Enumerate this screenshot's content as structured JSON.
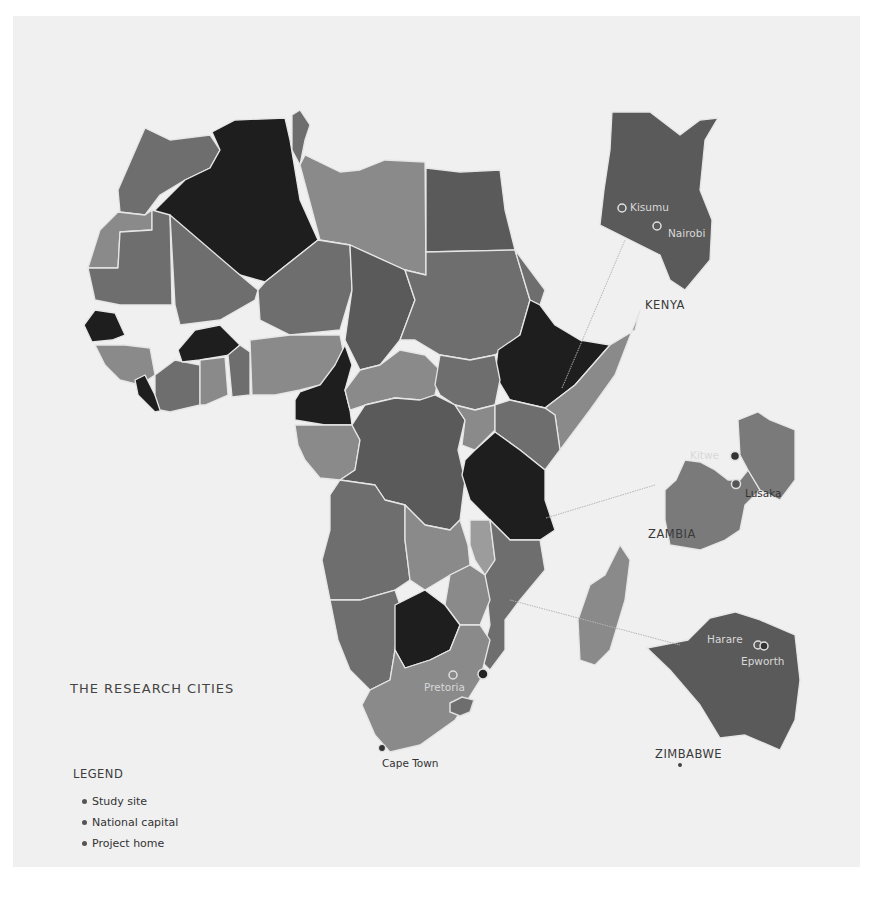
{
  "title": "THE RESEARCH CITIES",
  "legend": {
    "title": "LEGEND",
    "items": [
      {
        "label": "Study site",
        "icon": "study-site-dot"
      },
      {
        "label": "National capital",
        "icon": "national-capital-dot"
      },
      {
        "label": "Project home",
        "icon": "project-home-dot"
      }
    ]
  },
  "colors": {
    "background": "#ffffff",
    "panel": "#f0f0f0",
    "darkest": "#1e1e1e",
    "dark": "#555555",
    "medium": "#6e6e6e",
    "light": "#8a8a8a",
    "lighter": "#9c9c9c",
    "border": "#e6e6e6",
    "leader_line": "#b5b5b5"
  },
  "insets": [
    {
      "country": "KENYA",
      "cities": [
        {
          "name": "Kisumu"
        },
        {
          "name": "Nairobi"
        }
      ]
    },
    {
      "country": "ZAMBIA",
      "cities": [
        {
          "name": "Kitwe"
        },
        {
          "name": "Lusaka"
        }
      ]
    },
    {
      "country": "ZIMBABWE",
      "cities": [
        {
          "name": "Harare"
        },
        {
          "name": "Epworth"
        }
      ]
    }
  ],
  "main_map_cities": [
    {
      "name": "Pretoria"
    },
    {
      "name": "Cape Town"
    }
  ],
  "map_shapes": {
    "countries": [
      {
        "name": "morocco",
        "fill": "#6e6e6e",
        "points": "118,190 145,128 170,140 210,135 220,150 210,168 185,180 160,195 145,215 120,212"
      },
      {
        "name": "western-sahara",
        "fill": "#8a8a8a",
        "points": "88,268 100,230 118,212 145,215 152,210 152,230 120,232 118,268"
      },
      {
        "name": "algeria",
        "fill": "#1e1e1e",
        "points": "155,210 185,180 210,168 220,150 212,132 235,120 285,118 290,140 300,200 318,240 265,282 240,275 155,215"
      },
      {
        "name": "tunisia",
        "fill": "#6e6e6e",
        "points": "292,115 300,110 310,125 305,140 300,165 292,150"
      },
      {
        "name": "libya",
        "fill": "#8a8a8a",
        "points": "300,165 305,155 340,172 360,170 385,160 425,162 426,275 405,270 350,245 320,240"
      },
      {
        "name": "egypt",
        "fill": "#5a5a5a",
        "points": "426,168 460,172 500,170 505,210 515,250 426,252"
      },
      {
        "name": "mauritania",
        "fill": "#6e6e6e",
        "points": "88,268 118,268 120,232 152,230 152,210 170,215 172,305 120,305 95,300"
      },
      {
        "name": "mali",
        "fill": "#6e6e6e",
        "points": "170,215 240,275 258,290 255,300 220,320 180,325 175,305"
      },
      {
        "name": "niger",
        "fill": "#6e6e6e",
        "points": "258,290 265,282 318,240 350,245 352,290 340,330 290,335 260,320"
      },
      {
        "name": "chad",
        "fill": "#5a5a5a",
        "points": "350,245 405,270 415,300 400,340 380,365 360,370 345,340 352,290"
      },
      {
        "name": "sudan",
        "fill": "#6e6e6e",
        "points": "426,252 515,250 530,300 520,335 495,355 470,360 440,355 415,340 400,340 415,300 405,270 426,275"
      },
      {
        "name": "eritrea",
        "fill": "#6e6e6e",
        "points": "515,250 545,290 540,305 530,300"
      },
      {
        "name": "ethiopia",
        "fill": "#1e1e1e",
        "points": "498,350 520,335 530,300 540,305 555,325 580,340 610,345 575,385 545,408 510,400 495,375"
      },
      {
        "name": "somalia",
        "fill": "#8a8a8a",
        "points": "575,385 610,345 635,330 640,310 615,375 590,410 560,450 555,415 545,408"
      },
      {
        "name": "senegal",
        "fill": "#1e1e1e",
        "points": "84,325 95,310 115,313 125,335 112,340 92,342"
      },
      {
        "name": "guinea",
        "fill": "#8a8a8a",
        "points": "95,345 125,345 150,348 155,375 140,385 120,380 105,365"
      },
      {
        "name": "sierra-leone-liberia",
        "fill": "#1e1e1e",
        "points": "135,380 145,375 155,395 165,410 155,412 138,395"
      },
      {
        "name": "cote-divoire",
        "fill": "#6e6e6e",
        "points": "155,375 175,360 200,365 200,405 170,412 160,410 155,395"
      },
      {
        "name": "burkina-faso",
        "fill": "#1e1e1e",
        "points": "178,350 195,330 220,325 240,345 230,355 200,360 182,362"
      },
      {
        "name": "ghana",
        "fill": "#8a8a8a",
        "points": "200,360 225,357 228,395 205,405 200,405"
      },
      {
        "name": "togo-benin",
        "fill": "#6e6e6e",
        "points": "228,355 240,345 250,352 250,395 232,397"
      },
      {
        "name": "nigeria",
        "fill": "#8a8a8a",
        "points": "250,340 290,335 340,335 345,360 335,375 320,385 300,390 275,395 252,395"
      },
      {
        "name": "cameroon",
        "fill": "#1e1e1e",
        "points": "300,392 320,385 335,365 345,345 352,365 345,390 350,410 352,425 325,425 295,420 295,400"
      },
      {
        "name": "car",
        "fill": "#8a8a8a",
        "points": "345,390 360,370 380,365 400,350 425,355 440,370 435,395 420,400 395,398 365,405 350,410"
      },
      {
        "name": "south-sudan",
        "fill": "#6e6e6e",
        "points": "440,355 470,360 495,355 500,380 495,405 475,410 455,405 440,395 435,385"
      },
      {
        "name": "gabon-congo",
        "fill": "#8a8a8a",
        "points": "295,425 325,425 352,425 360,440 355,470 340,480 320,478 305,460 298,445"
      },
      {
        "name": "drc",
        "fill": "#5a5a5a",
        "points": "352,425 365,405 395,398 420,400 435,395 455,405 465,420 458,450 465,480 460,520 450,530 425,525 405,505 385,500 375,485 340,480 355,470 360,440"
      },
      {
        "name": "uganda",
        "fill": "#8a8a8a",
        "points": "455,405 475,410 495,405 495,430 475,450 462,445 465,420"
      },
      {
        "name": "kenya-main",
        "fill": "#6e6e6e",
        "points": "495,405 510,400 545,408 555,415 560,450 545,470 520,450 495,432"
      },
      {
        "name": "tanzania",
        "fill": "#1e1e1e",
        "points": "475,450 495,432 520,450 545,470 545,500 555,530 540,540 510,540 490,520 470,500 462,475 465,460"
      },
      {
        "name": "angola",
        "fill": "#6e6e6e",
        "points": "330,495 340,480 375,485 385,500 405,505 405,540 410,580 395,590 360,600 330,600 322,560 330,530"
      },
      {
        "name": "zambia-main",
        "fill": "#8a8a8a",
        "points": "405,505 425,525 450,530 460,520 468,545 470,565 450,575 425,590 410,580 405,540"
      },
      {
        "name": "malawi",
        "fill": "#9c9c9c",
        "points": "470,520 490,520 495,560 485,575 475,560 470,545"
      },
      {
        "name": "mozambique",
        "fill": "#6e6e6e",
        "points": "490,520 510,540 540,540 545,570 520,600 505,620 505,650 490,670 480,660 490,625 485,575 495,560"
      },
      {
        "name": "zimbabwe-main",
        "fill": "#8a8a8a",
        "points": "450,575 470,565 485,575 490,600 480,625 460,625 445,605"
      },
      {
        "name": "namibia",
        "fill": "#6e6e6e",
        "points": "330,600 360,600 395,590 400,605 395,650 390,680 370,690 350,670 338,640"
      },
      {
        "name": "botswana",
        "fill": "#1e1e1e",
        "points": "395,605 425,590 445,605 460,625 450,650 430,660 405,668 395,650"
      },
      {
        "name": "south-africa",
        "fill": "#8a8a8a",
        "points": "370,690 390,680 395,650 405,668 430,660 450,650 460,625 480,625 490,640 480,680 455,720 420,745 390,752 375,735 362,705"
      },
      {
        "name": "madagascar",
        "fill": "#8a8a8a",
        "points": "620,545 630,560 625,600 610,650 595,665 580,660 578,620 590,585 605,575"
      },
      {
        "name": "kenya-inset",
        "fill": "#5a5a5a",
        "points": "612,112 650,112 680,135 700,120 718,118 705,140 700,190 712,220 710,260 685,290 670,280 660,255 600,225 604,190 610,150"
      },
      {
        "name": "zambia-inset",
        "fill": "#7a7a7a",
        "points": "676,480 685,460 700,462 715,470 728,480 740,480 748,470 760,490 745,505 740,530 725,540 700,550 670,545 665,520 665,490"
      },
      {
        "name": "malawi-inset",
        "fill": "#7a7a7a",
        "points": "738,420 758,412 770,420 795,430 795,480 780,500 760,490 748,470 740,455"
      },
      {
        "name": "zimbabwe-inset",
        "fill": "#5a5a5a",
        "points": "647,648 688,640 710,618 735,612 760,620 795,635 800,680 795,720 780,750 745,735 720,738 700,705 670,670"
      }
    ],
    "leader_lines": [
      {
        "x1": "562",
        "y1": "388",
        "x2": "625",
        "y2": "240"
      },
      {
        "x1": "546",
        "y1": "518",
        "x2": "655",
        "y2": "485"
      },
      {
        "x1": "510",
        "y1": "600",
        "x2": "680",
        "y2": "645"
      }
    ]
  }
}
